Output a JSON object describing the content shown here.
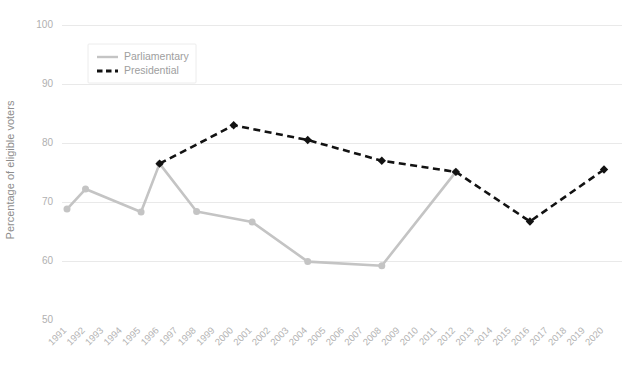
{
  "chart_data": {
    "type": "line",
    "title": "",
    "xlabel": "",
    "ylabel": "Percentage of eligible voters",
    "ylim": [
      50,
      100
    ],
    "yticks": [
      50,
      60,
      70,
      80,
      90,
      100
    ],
    "grid": true,
    "legend_position": "top-left",
    "x": [
      1991,
      1992,
      1993,
      1994,
      1995,
      1996,
      1997,
      1998,
      1999,
      2000,
      2001,
      2002,
      2003,
      2004,
      2005,
      2006,
      2007,
      2008,
      2009,
      2010,
      2011,
      2012,
      2013,
      2014,
      2015,
      2016,
      2017,
      2018,
      2019,
      2020
    ],
    "series": [
      {
        "name": "Parliamentary",
        "color": "#c4c4c4",
        "style": "solid",
        "marker": "circle",
        "points": [
          {
            "x": 1991,
            "y": 68.8
          },
          {
            "x": 1992,
            "y": 72.2
          },
          {
            "x": 1995,
            "y": 68.3
          },
          {
            "x": 1996,
            "y": 76.5
          },
          {
            "x": 1998,
            "y": 68.4
          },
          {
            "x": 2001,
            "y": 66.6
          },
          {
            "x": 2004,
            "y": 59.9
          },
          {
            "x": 2008,
            "y": 59.2
          },
          {
            "x": 2012,
            "y": 75.1
          }
        ]
      },
      {
        "name": "Presidential",
        "color": "#121212",
        "style": "dashed",
        "marker": "diamond",
        "points": [
          {
            "x": 1996,
            "y": 76.5
          },
          {
            "x": 2000,
            "y": 83.0
          },
          {
            "x": 2004,
            "y": 80.5
          },
          {
            "x": 2008,
            "y": 77.0
          },
          {
            "x": 2012,
            "y": 75.1
          },
          {
            "x": 2016,
            "y": 66.7
          },
          {
            "x": 2020,
            "y": 75.5
          }
        ]
      }
    ]
  },
  "legend": {
    "items": [
      {
        "label": "Parliamentary"
      },
      {
        "label": "Presidential"
      }
    ]
  },
  "axes": {
    "y_title": "Percentage of eligible voters",
    "y_tick_labels": [
      "100",
      "90",
      "80",
      "70",
      "60",
      "50"
    ],
    "x_tick_labels": [
      "1991",
      "1992",
      "1993",
      "1994",
      "1995",
      "1996",
      "1997",
      "1998",
      "1999",
      "2000",
      "2001",
      "2002",
      "2003",
      "2004",
      "2005",
      "2006",
      "2007",
      "2008",
      "2009",
      "2010",
      "2011",
      "2012",
      "2013",
      "2014",
      "2015",
      "2016",
      "2017",
      "2018",
      "2019",
      "2020"
    ]
  },
  "colors": {
    "parliamentary": "#c4c4c4",
    "presidential": "#121212",
    "gridline": "#e9e9e9",
    "tick_text": "#b3b3b3",
    "axis_title": "#8d8d8d",
    "background": "#ffffff"
  }
}
